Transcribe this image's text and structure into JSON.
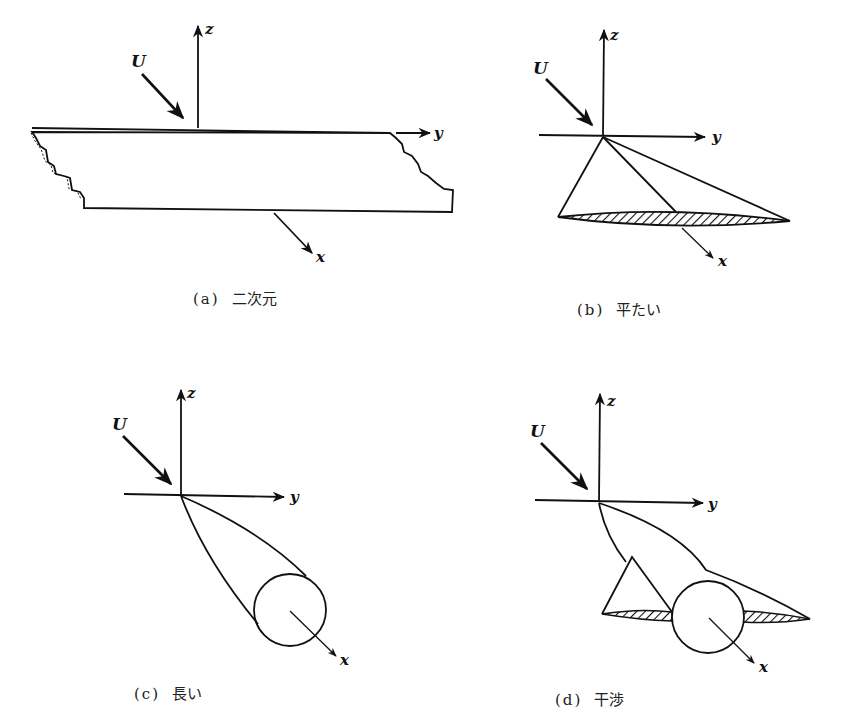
{
  "figure": {
    "panels": [
      {
        "id": "a",
        "tag": "(a)",
        "caption": "二次元",
        "axes": {
          "z": "z",
          "y": "y",
          "x": "x"
        },
        "flow": "U"
      },
      {
        "id": "b",
        "tag": "(b)",
        "caption": "平たい",
        "axes": {
          "z": "z",
          "y": "y",
          "x": "x"
        },
        "flow": "U"
      },
      {
        "id": "c",
        "tag": "(c)",
        "caption": "長い",
        "axes": {
          "z": "z",
          "y": "y",
          "x": "x"
        },
        "flow": "U"
      },
      {
        "id": "d",
        "tag": "(d)",
        "caption": "干渉",
        "axes": {
          "z": "z",
          "y": "y",
          "x": "x"
        },
        "flow": "U"
      }
    ]
  }
}
